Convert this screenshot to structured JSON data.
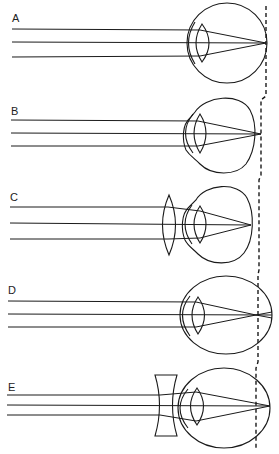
{
  "figure": {
    "retina_reference_line": "dashed vertical line",
    "panels": [
      {
        "label": "A",
        "condition": "emmetropic eye",
        "corrective_lens": "none",
        "focus": "on retina"
      },
      {
        "label": "B",
        "condition": "hyperopic (short) eye",
        "corrective_lens": "none",
        "focus": "behind retina"
      },
      {
        "label": "C",
        "condition": "hyperopic eye corrected",
        "corrective_lens": "convex",
        "focus": "on retina"
      },
      {
        "label": "D",
        "condition": "myopic (long) eye",
        "corrective_lens": "none",
        "focus": "in front of retina"
      },
      {
        "label": "E",
        "condition": "myopic eye corrected",
        "corrective_lens": "concave",
        "focus": "on retina"
      }
    ]
  },
  "colors": {
    "line": "#1a1a1a",
    "background": "#ffffff"
  }
}
